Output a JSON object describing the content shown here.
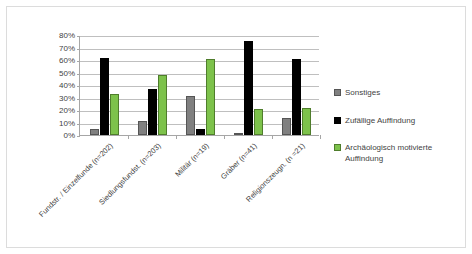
{
  "chart_data": {
    "type": "bar",
    "title": "",
    "xlabel": "",
    "ylabel": "",
    "ylim": [
      0,
      80
    ],
    "grid": true,
    "legend_position": "right",
    "categories": [
      "Fundstr. / Einzelfunde (n=202)",
      "Siedlungsfundst. (n=203)",
      "Militär (n=19)",
      "Gräber (n=41)",
      "Religionszeugn. (n =21)"
    ],
    "ytick_labels": [
      "0%",
      "10%",
      "20%",
      "30%",
      "40%",
      "50%",
      "60%",
      "70%",
      "80%"
    ],
    "ytick_values": [
      0,
      10,
      20,
      30,
      40,
      50,
      60,
      70,
      80
    ],
    "series": [
      {
        "name": "Sonstiges",
        "color": "#808080",
        "values": [
          5,
          11,
          31,
          2,
          14
        ]
      },
      {
        "name": "Zufällige Auffindung",
        "color": "#000000",
        "values": [
          62,
          37,
          5,
          75,
          61
        ]
      },
      {
        "name": "Archäologisch motivierte Auffindung",
        "color": "#7DC24B",
        "values": [
          33,
          48,
          61,
          21,
          22
        ]
      }
    ],
    "legend": [
      {
        "label": "Sonstiges",
        "color": "#808080"
      },
      {
        "label": "Zufällige Auffindung",
        "color": "#000000"
      },
      {
        "label": "Archäologisch motivierte Auffindung",
        "color": "#7DC24B"
      }
    ]
  }
}
